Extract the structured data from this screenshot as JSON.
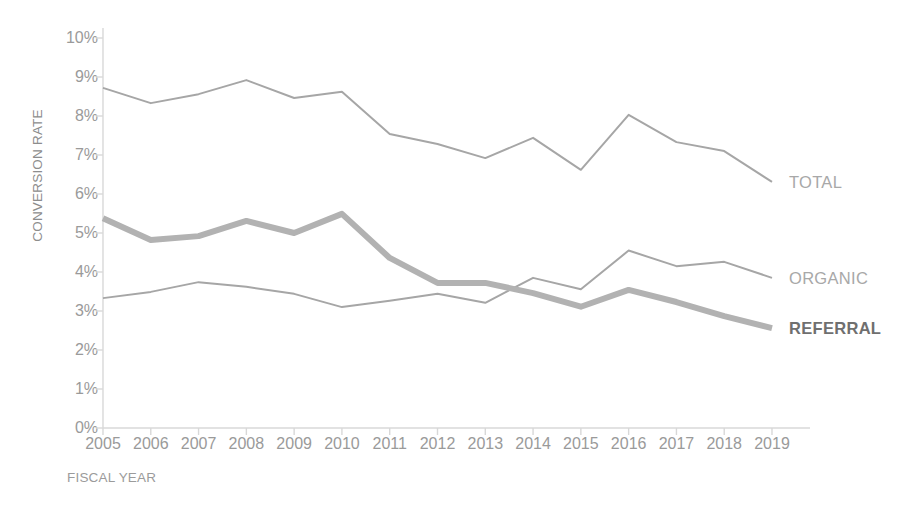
{
  "chart_data": {
    "type": "line",
    "title": "",
    "xlabel": "FISCAL YEAR",
    "ylabel": "CONVERSION RATE",
    "categories": [
      "2005",
      "2006",
      "2007",
      "2008",
      "2009",
      "2010",
      "2011",
      "2012",
      "2013",
      "2014",
      "2015",
      "2016",
      "2017",
      "2018",
      "2019"
    ],
    "ytick_labels": [
      "10%",
      "9%",
      "8%",
      "7%",
      "6%",
      "5%",
      "4%",
      "3%",
      "2%",
      "1%",
      "0%"
    ],
    "ytick_values": [
      10,
      9,
      8,
      7,
      6,
      5,
      4,
      3,
      2,
      1,
      0
    ],
    "ylim": [
      0,
      10
    ],
    "yunit": "percent",
    "grid": false,
    "legend_position": "right-inline-labels",
    "series": [
      {
        "name": "TOTAL",
        "color": "#a6a6a6",
        "width": 2,
        "bold": false,
        "values": [
          8.72,
          8.33,
          8.56,
          8.92,
          8.46,
          8.62,
          7.54,
          7.28,
          6.92,
          7.44,
          6.62,
          8.03,
          7.33,
          7.1,
          6.31
        ]
      },
      {
        "name": "ORGANIC",
        "color": "#a6a6a6",
        "width": 2,
        "bold": false,
        "values": [
          3.33,
          3.49,
          3.74,
          3.62,
          3.44,
          3.1,
          3.26,
          3.44,
          3.21,
          3.85,
          3.56,
          4.55,
          4.15,
          4.26,
          3.85
        ]
      },
      {
        "name": "REFERRAL",
        "color": "#b2b2b2",
        "width": 6,
        "bold": true,
        "values": [
          5.38,
          4.82,
          4.92,
          5.31,
          5.0,
          5.49,
          4.36,
          3.72,
          3.72,
          3.46,
          3.11,
          3.54,
          3.23,
          2.87,
          2.56
        ]
      }
    ],
    "series_labels": [
      {
        "text": "TOTAL",
        "value_at_end": 6.31,
        "style": "normal"
      },
      {
        "text": "ORGANIC",
        "value_at_end": 3.85,
        "style": "normal"
      },
      {
        "text": "REFERRAL",
        "value_at_end": 2.56,
        "style": "bold"
      }
    ],
    "axis_color": "#d8d8d8",
    "tick_text_color": "#9a9a9a"
  },
  "top_banner": {
    "text": ""
  }
}
